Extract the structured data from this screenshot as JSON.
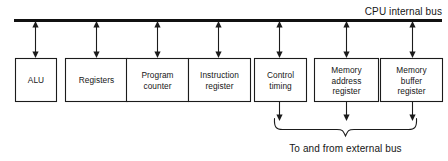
{
  "diagram": {
    "bus": {
      "label": "CPU internal bus",
      "line_color": "#111111"
    },
    "units": [
      {
        "id": "alu",
        "label_line1": "ALU",
        "label_line2": "",
        "connects_external": false
      },
      {
        "id": "registers",
        "label_line1": "Registers",
        "label_line2": "",
        "connects_external": false
      },
      {
        "id": "program-counter",
        "label_line1": "Program",
        "label_line2": "counter",
        "connects_external": false
      },
      {
        "id": "instruction-register",
        "label_line1": "Instruction",
        "label_line2": "register",
        "connects_external": false
      },
      {
        "id": "control-timing",
        "label_line1": "Control",
        "label_line2": "timing",
        "connects_external": true
      },
      {
        "id": "memory-address-register",
        "label_line1": "Memory",
        "label_line2": "address",
        "label_line3": "register",
        "connects_external": true
      },
      {
        "id": "memory-buffer-register",
        "label_line1": "Memory",
        "label_line2": "buffer",
        "label_line3": "register",
        "connects_external": true
      }
    ],
    "external": {
      "label": "To and from external bus"
    },
    "colors": {
      "stroke": "#1b1b1b",
      "background": "#ffffff",
      "text": "#161616"
    }
  }
}
